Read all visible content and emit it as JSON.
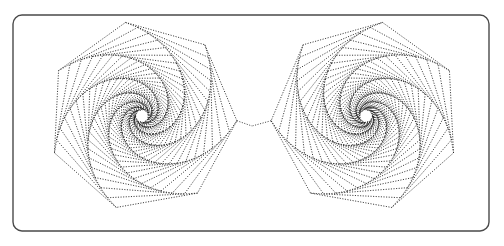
{
  "figure": {
    "background_color": "#ffffff",
    "width": 504,
    "height": 246
  },
  "frame": {
    "name": "rounded-rectangle-border",
    "x": 13,
    "y": 15,
    "width": 476,
    "height": 216,
    "corner_radius": 9,
    "stroke_color": "#4a4a4a",
    "stroke_width": 1.4,
    "fill": "none"
  },
  "line_style": {
    "stroke_color": "#1a1a1a",
    "stroke_width": 0.85,
    "dash_on": 1.1,
    "dash_off": 1.5,
    "description": "dotted"
  },
  "chart_data": {
    "type": "line",
    "subtitle": "Two mirrored turtle-graphics polygon spirals joined at center",
    "xlabel": "",
    "ylabel": "",
    "xlim": [
      0,
      504
    ],
    "ylim": [
      0,
      246
    ],
    "grid": false,
    "legend": "none",
    "series": [
      {
        "name": "left-spiral",
        "handedness": "counter-clockwise",
        "center_x": 142,
        "center_y": 116,
        "polygon_sides": 7,
        "start_radius": 95,
        "end_radius": 3.0,
        "shrink_factor": 0.934,
        "rotation_step_deg": 7.2,
        "turns": 40,
        "start_angle_deg": -100
      },
      {
        "name": "right-spiral",
        "handedness": "clockwise",
        "center_x": 366,
        "center_y": 116,
        "polygon_sides": 7,
        "start_radius": 95,
        "end_radius": 3.0,
        "shrink_factor": 0.934,
        "rotation_step_deg": -7.2,
        "turns": 40,
        "start_angle_deg": -80
      }
    ],
    "annotations": [
      {
        "name": "center-join",
        "shape": "v-notch",
        "x": 252,
        "y": 126,
        "note": "Outer polygon edges of both spirals converge to a point between the figures"
      }
    ]
  }
}
